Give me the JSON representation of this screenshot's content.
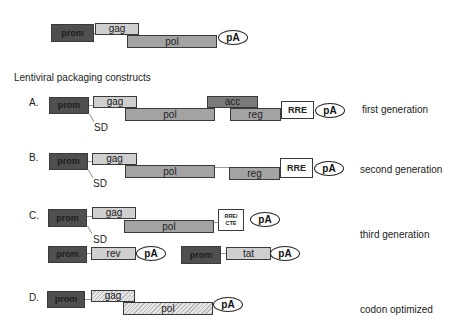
{
  "title": "Lentiviral packaging constructs",
  "top_construct": {
    "prom": "prom",
    "gag": "gag",
    "pol": "pol",
    "pA": "pA"
  },
  "constructs": [
    {
      "letter": "A.",
      "generation": "first generation",
      "prom": "prom",
      "sd": "SD",
      "gag": "gag",
      "pol": "pol",
      "acc": "acc",
      "reg": "reg",
      "rre": "RRE",
      "pA": "pA"
    },
    {
      "letter": "B.",
      "generation": "second generation",
      "prom": "prom",
      "sd": "SD",
      "gag": "gag",
      "pol": "pol",
      "reg": "reg",
      "rre": "RRE",
      "pA": "pA"
    },
    {
      "letter": "C.",
      "generation": "third generation",
      "prom": "prom",
      "sd": "SD",
      "gag": "gag",
      "pol": "pol",
      "rre_cte_1": "RRE/",
      "rre_cte_2": "CTE",
      "pA": "pA",
      "rev_construct": {
        "prom": "prom",
        "gene": "rev",
        "pA": "pA"
      },
      "tat_construct": {
        "prom": "prom",
        "gene": "tat",
        "pA": "pA"
      }
    },
    {
      "letter": "D.",
      "generation": "codon optimized",
      "prom": "prom",
      "gag": "gag",
      "pol": "pol",
      "pA": "pA"
    }
  ],
  "colors": {
    "prom": "#4f4f4f",
    "gag": "#cfcfcf",
    "pol": "#a3a3a3",
    "acc": "#7a7a7a",
    "reg": "#a3a3a3",
    "rre": "#ffffff"
  }
}
